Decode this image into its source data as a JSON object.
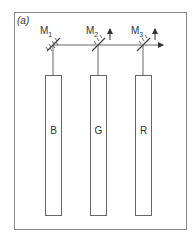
{
  "figure": {
    "panel_label": "(a)",
    "mirrors": [
      {
        "name": "M",
        "sub": "1"
      },
      {
        "name": "M",
        "sub": "2"
      },
      {
        "name": "M",
        "sub": "3"
      }
    ],
    "channels": [
      {
        "label": "B"
      },
      {
        "label": "G"
      },
      {
        "label": "R"
      }
    ],
    "colors": {
      "line": "#555555",
      "frame": "#888888"
    }
  }
}
